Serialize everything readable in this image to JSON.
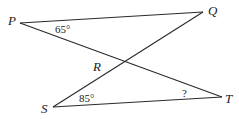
{
  "diagram": {
    "points": {
      "P": {
        "label": "P",
        "x": 20,
        "y": 23
      },
      "Q": {
        "label": "Q",
        "x": 203,
        "y": 12
      },
      "S": {
        "label": "S",
        "x": 53,
        "y": 107
      },
      "T": {
        "label": "T",
        "x": 222,
        "y": 97
      },
      "R": {
        "label": "R",
        "x": 124,
        "y": 61
      }
    },
    "segments": [
      [
        "P",
        "Q"
      ],
      [
        "P",
        "T"
      ],
      [
        "S",
        "Q"
      ],
      [
        "S",
        "T"
      ]
    ],
    "angles": {
      "P": "65°",
      "S": "85°",
      "T": "?"
    }
  }
}
